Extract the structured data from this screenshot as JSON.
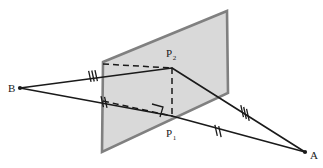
{
  "figure": {
    "type": "geometry-diagram",
    "canvas": {
      "width": 323,
      "height": 168,
      "background": "#ffffff"
    },
    "colors": {
      "plane_fill": "#d9d9d9",
      "plane_stroke": "#808080",
      "line_stroke": "#1a1a1a",
      "dashed_stroke": "#1a1a1a",
      "label_color": "#1a1a1a"
    },
    "plane": {
      "name": "bisecting-plane",
      "fill": "#d9d9d9",
      "stroke": "#808080",
      "stroke_width": 2.6,
      "points": "103,62 227,11 228,93 102,152"
    },
    "points": [
      {
        "id": "A",
        "label": "A",
        "sub": "",
        "x": 305,
        "y": 152,
        "label_x": 310,
        "label_y": 159,
        "dot": true
      },
      {
        "id": "B",
        "label": "B",
        "sub": "",
        "x": 20,
        "y": 88,
        "label_x": 8,
        "label_y": 92,
        "dot": true
      },
      {
        "id": "P2",
        "label": "P",
        "sub": "2",
        "x": 172,
        "y": 68,
        "label_x": 166,
        "label_y": 57,
        "dot": false
      },
      {
        "id": "P1",
        "label": "P",
        "sub": "1",
        "x": 172,
        "y": 116,
        "label_x": 166,
        "label_y": 137,
        "dot": false
      }
    ],
    "solid_segments": [
      {
        "name": "segment-b-to-p2",
        "x1": 20,
        "y1": 88,
        "x2": 172,
        "y2": 68
      },
      {
        "name": "segment-b-to-p1",
        "x1": 20,
        "y1": 88,
        "x2": 172,
        "y2": 116
      },
      {
        "name": "segment-p2-to-a",
        "x1": 172,
        "y1": 68,
        "x2": 305,
        "y2": 152
      },
      {
        "name": "segment-p1-to-a",
        "x1": 172,
        "y1": 116,
        "x2": 305,
        "y2": 152
      }
    ],
    "dashed_segments": [
      {
        "name": "dashed-plane-edge-to-p2",
        "x1": 103,
        "y1": 64,
        "x2": 172,
        "y2": 68
      },
      {
        "name": "dashed-p2-to-p1-vertical",
        "x1": 172,
        "y1": 68,
        "x2": 172,
        "y2": 116
      },
      {
        "name": "dashed-plane-edge-to-p1",
        "x1": 103,
        "y1": 101,
        "x2": 172,
        "y2": 116
      }
    ],
    "right_angle_marker": {
      "name": "right-angle-marker-at-p1",
      "path": "M 152,104 L 163,107 L 160,117"
    },
    "tick_marks": [
      {
        "name": "tick-triple-b-p2",
        "count": 3,
        "cx": 93,
        "cy": 76,
        "angle_deg": -7.5,
        "spacing": 3.2,
        "length": 11
      },
      {
        "name": "tick-double-b-p1",
        "count": 2,
        "cx": 104,
        "cy": 102,
        "angle_deg": 10.4,
        "spacing": 3.6,
        "length": 11
      },
      {
        "name": "tick-triple-p2-a",
        "count": 3,
        "cx": 245,
        "cy": 113,
        "angle_deg": 32.3,
        "spacing": 3.4,
        "length": 12
      },
      {
        "name": "tick-double-p1-a",
        "count": 2,
        "cx": 218,
        "cy": 131,
        "angle_deg": 16.8,
        "spacing": 4.0,
        "length": 11
      }
    ]
  }
}
